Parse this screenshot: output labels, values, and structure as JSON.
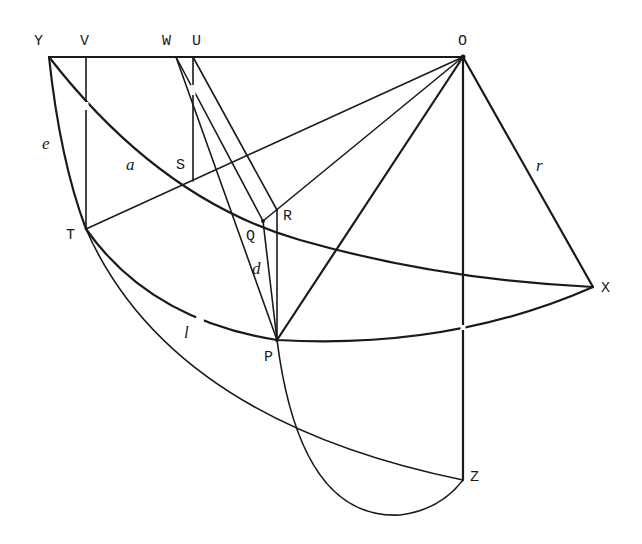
{
  "diagram": {
    "type": "geometric-construction",
    "line_color": "#1a1a1a",
    "background": "#ffffff",
    "points": {
      "Y": {
        "label": "Y",
        "x": 49,
        "y": 57
      },
      "V": {
        "label": "V",
        "x": 86,
        "y": 57
      },
      "W": {
        "label": "W",
        "x": 176,
        "y": 57
      },
      "U": {
        "label": "U",
        "x": 193,
        "y": 57
      },
      "O": {
        "label": "O",
        "x": 463,
        "y": 57
      },
      "S": {
        "label": "S",
        "x": 193,
        "y": 181
      },
      "R": {
        "label": "R",
        "x": 277,
        "y": 210
      },
      "Q": {
        "label": "Q",
        "x": 263,
        "y": 221
      },
      "T": {
        "label": "T",
        "x": 86,
        "y": 229
      },
      "X": {
        "label": "X",
        "x": 593,
        "y": 287
      },
      "P": {
        "label": "P",
        "x": 277,
        "y": 340
      },
      "Z": {
        "label": "Z",
        "x": 463,
        "y": 480
      }
    },
    "arc_labels": {
      "e": "e",
      "a": "a",
      "d": "d",
      "l": "l",
      "r": "r"
    },
    "segments": [
      [
        "Y",
        "O"
      ],
      [
        "O",
        "X"
      ],
      [
        "O",
        "Z"
      ],
      [
        "V",
        "T"
      ],
      [
        "U",
        "S"
      ],
      [
        "W",
        "P"
      ],
      [
        "U",
        "R"
      ],
      [
        "Q",
        "P"
      ],
      [
        "R",
        "P"
      ],
      [
        "T",
        "O"
      ],
      [
        "Q",
        "O"
      ],
      [
        "P",
        "O"
      ]
    ],
    "arcs": [
      "Y-T-Z (e)",
      "Y-Q-X (a)",
      "T-P-X (l)",
      "P-Z (lower)"
    ]
  }
}
